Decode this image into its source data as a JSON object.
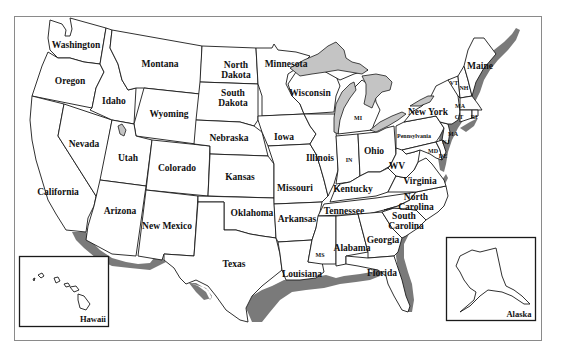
{
  "map": {
    "title": "United States Map",
    "colors": {
      "land": "#ffffff",
      "border": "#1a1a1a",
      "lakes": "#c4c4c4",
      "coastal_shelf": "#7a7a7a",
      "frame": "#8a8a8a"
    },
    "states": {
      "washington": "Washington",
      "oregon": "Oregon",
      "california": "California",
      "nevada": "Nevada",
      "idaho": "Idaho",
      "montana": "Montana",
      "wyoming": "Wyoming",
      "utah": "Utah",
      "colorado": "Colorado",
      "arizona": "Arizona",
      "new_mexico": "New Mexico",
      "north_dakota_1": "North",
      "north_dakota_2": "Dakota",
      "south_dakota_1": "South",
      "south_dakota_2": "Dakota",
      "nebraska": "Nebraska",
      "kansas": "Kansas",
      "oklahoma": "Oklahoma",
      "texas": "Texas",
      "minnesota": "Minnesota",
      "iowa": "Iowa",
      "missouri": "Missouri",
      "arkansas": "Arkansas",
      "louisiana": "Louisiana",
      "wisconsin": "Wisconsin",
      "illinois": "Illinois",
      "michigan": "MI",
      "indiana": "IN",
      "ohio": "Ohio",
      "kentucky": "Kentucky",
      "tennessee": "Tennessee",
      "mississippi": "MS",
      "alabama": "Alabama",
      "georgia": "Georgia",
      "florida": "Florida",
      "south_carolina_1": "South",
      "south_carolina_2": "Carolina",
      "north_carolina_1": "North",
      "north_carolina_2": "Carolina",
      "virginia": "Virginia",
      "west_virginia": "WV",
      "pennsylvania": "Pennsylvania",
      "new_york": "New York",
      "maryland": "MD",
      "delaware": "DE",
      "new_jersey": "NJ",
      "connecticut": "CT",
      "rhode_island": "RI",
      "massachusetts": "MA",
      "massachusetts_2": "MA",
      "vermont": "VT",
      "new_hampshire": "NH",
      "maine": "Maine"
    },
    "insets": {
      "hawaii": "Hawaii",
      "alaska": "Alaska"
    }
  }
}
